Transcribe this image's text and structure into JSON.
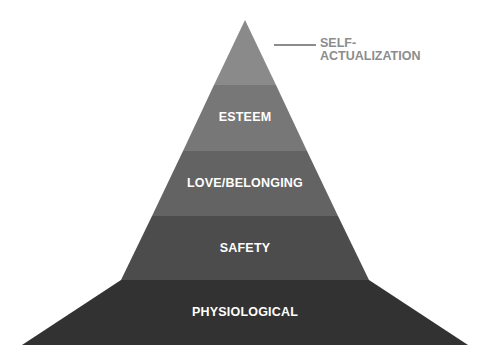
{
  "diagram": {
    "levels": [
      {
        "label": "SELF-ACTUALIZATION",
        "label_line1": "SELF-",
        "label_line2": "ACTUALIZATION",
        "color": "#8a8a8a"
      },
      {
        "label": "ESTEEM",
        "color": "#777777"
      },
      {
        "label": "LOVE/BELONGING",
        "color": "#636363"
      },
      {
        "label": "SAFETY",
        "color": "#4c4c4c"
      },
      {
        "label": "PHYSIOLOGICAL",
        "color": "#323232"
      }
    ],
    "callout_color": "#8c8c8c"
  }
}
